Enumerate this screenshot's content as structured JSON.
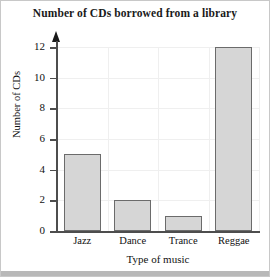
{
  "chart_data": {
    "type": "bar",
    "title": "Number of CDs borrowed from a library",
    "xlabel": "Type of music",
    "ylabel": "Number of CDs",
    "categories": [
      "Jazz",
      "Dance",
      "Trance",
      "Reggae"
    ],
    "values": [
      5,
      2,
      1,
      12
    ],
    "ylim": [
      0,
      12
    ],
    "ytick_step": 2,
    "yticks": [
      0,
      2,
      4,
      6,
      8,
      10,
      12
    ],
    "ytick_labels": [
      "0",
      "2",
      "4",
      "6",
      "8",
      "10",
      "12"
    ],
    "grid": true,
    "legend": null,
    "colors": {
      "bar_fill": "#d6d6d6",
      "bar_edge": "#6b6b6b",
      "axis": "#4d4d4d",
      "grid": "#efefef",
      "text": "#111111",
      "background": "#ffffff"
    }
  }
}
